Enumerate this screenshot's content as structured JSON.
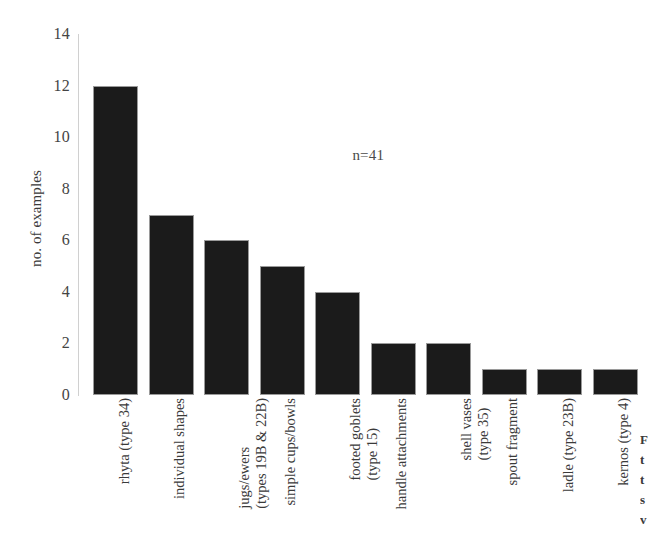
{
  "chart_data": {
    "type": "bar",
    "title": "",
    "xlabel": "",
    "ylabel": "no. of examples",
    "ylim": [
      0,
      14
    ],
    "yticks": [
      0,
      2,
      4,
      6,
      8,
      10,
      12,
      14
    ],
    "grid": false,
    "legend": null,
    "annotations": [
      {
        "text": "n=41",
        "x_frac": 0.49,
        "y_value": 9.6
      }
    ],
    "categories": [
      "rhyta (type 34)",
      "individual shapes",
      "jugs/ewers (types 19B & 22B)",
      "simple cups/bowls",
      "footed goblets (type 15)",
      "handle attachments",
      "shell vases (type 35)",
      "spout fragment",
      "ladle (type 23B)",
      "kernos (type 4)"
    ],
    "category_lines": [
      [
        "rhyta (type 34)"
      ],
      [
        "individual shapes"
      ],
      [
        "jugs/ewers",
        "(types 19B & 22B)"
      ],
      [
        "simple cups/bowls"
      ],
      [
        "footed goblets",
        "(type 15)"
      ],
      [
        "handle attachments"
      ],
      [
        "shell vases",
        "(type 35)"
      ],
      [
        "spout fragment"
      ],
      [
        "ladle (type 23B)"
      ],
      [
        "kernos (type 4)"
      ]
    ],
    "values": [
      12,
      7,
      6,
      5,
      4,
      2,
      2,
      1,
      1,
      1
    ],
    "total": 41,
    "bar_color": "#1b1b1b"
  },
  "edge_caption": {
    "lines": [
      "F",
      "t",
      "t",
      "s",
      "v"
    ]
  }
}
